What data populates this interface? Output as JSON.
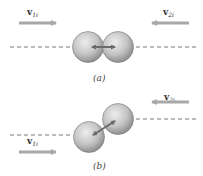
{
  "diagram": {
    "panel_a": {
      "caption": "(a)",
      "v1": {
        "symbol": "v",
        "subscript": "1i"
      },
      "v2": {
        "symbol": "v",
        "subscript": "2i"
      },
      "description": "head-on collision, spheres aligned along dashed line"
    },
    "panel_b": {
      "caption": "(b)",
      "v1": {
        "symbol": "v",
        "subscript": "1i"
      },
      "v2": {
        "symbol": "v",
        "subscript": "2i"
      },
      "description": "glancing collision, spheres offset along parallel dashed lines"
    },
    "colors": {
      "arrow": "#a8a8a8",
      "sphere_light": "#e6e6e6",
      "sphere_dark": "#8f8f8f",
      "contact_arrow": "#6e6e6e",
      "dashed_line": "#555555"
    }
  }
}
